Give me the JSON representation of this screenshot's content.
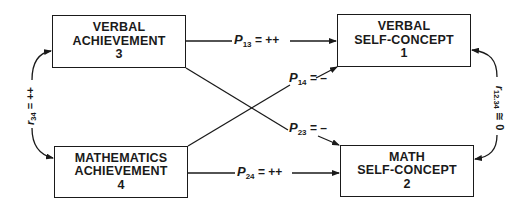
{
  "diagram": {
    "type": "path-model",
    "nodes": [
      {
        "id": "3",
        "line1": "VERBAL",
        "line2": "ACHIEVEMENT",
        "number": "3"
      },
      {
        "id": "1",
        "line1": "VERBAL",
        "line2": "SELF-CONCEPT",
        "number": "1"
      },
      {
        "id": "4",
        "line1": "MATHEMATICS",
        "line2": "ACHIEVEMENT",
        "number": "4"
      },
      {
        "id": "2",
        "line1": "MATH",
        "line2": "SELF-CONCEPT",
        "number": "2"
      }
    ],
    "paths": [
      {
        "from": "3",
        "to": "1",
        "symbol": "P",
        "sub": "13",
        "value": "= ++"
      },
      {
        "from": "4",
        "to": "1",
        "symbol": "P",
        "sub": "14",
        "value": "= –"
      },
      {
        "from": "3",
        "to": "2",
        "symbol": "P",
        "sub": "23",
        "value": "= –"
      },
      {
        "from": "4",
        "to": "2",
        "symbol": "P",
        "sub": "24",
        "value": "= ++"
      }
    ],
    "correlations": [
      {
        "between": [
          "3",
          "4"
        ],
        "symbol": "r",
        "sub": "34",
        "value": "= ++"
      },
      {
        "between": [
          "1",
          "2"
        ],
        "symbol": "r",
        "sub": "12.34",
        "value": "≅ 0"
      }
    ]
  }
}
